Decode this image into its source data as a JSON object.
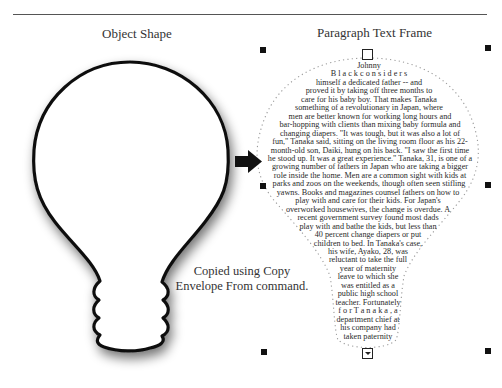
{
  "headings": {
    "object_shape": "Object Shape",
    "paragraph_text_frame": "Paragraph Text Frame"
  },
  "caption": {
    "line1": "Copied using Copy",
    "line2": "Envelope From command."
  },
  "arrow": {
    "icon": "right-arrow-icon",
    "color": "#111111"
  },
  "handles": {
    "selection_handles": [
      "top-left",
      "top-right",
      "middle-left",
      "middle-right",
      "bottom-left",
      "bottom-right"
    ],
    "top_center": "empty-square-handle",
    "bottom_center": "text-overflow-handle"
  },
  "paragraph": {
    "lines": [
      "Johnny",
      "B l a c k   c o n s i d e r s",
      "himself a dedicated father -- and",
      "proved it by taking off three months to",
      "care for his baby boy. That makes Tanaka",
      "something of a revolutionary in Japan, where",
      "men are better known for working long hours and",
      "bar-hopping with clients than mixing baby formula and",
      "changing diapers. \"It was tough, but it was also a lot of",
      "fun,\" Tanaka said, sitting on the living room floor as his 22-",
      "month-old son, Daiki, hung on his back. \"I saw the first time",
      "he stood up. It was a great experience.\" Tanaka, 31, is one of a",
      "growing number of fathers in Japan who are taking a bigger",
      "role inside the home. Men are a common sight with kids at",
      "parks and zoos on the weekends, though often seen stifling",
      "yawns. Books and magazines counsel fathers on how to",
      "play  with  and  care  for  their  kids.  For  Japan's",
      "overworked housewives, the change is overdue. A",
      "recent government survey found most dads",
      "play with and bathe the kids, but less than",
      "40  percent  change  diapers  or  put",
      "children to bed. In Tanaka's case,",
      "his  wife,  Ayako,  28,  was",
      "reluctant to take the full",
      "year  of  maternity",
      "leave to which she",
      "was  entitled  as  a",
      "public  high  school",
      "teacher. Fortunately",
      "f o r   T a n a k a ,   a",
      "department  chief  at",
      "his  company  had",
      "taken  paternity"
    ]
  },
  "colors": {
    "outline": "#111111",
    "shadow": "#9a9a9a",
    "envelope_dots": "#9a9a9a",
    "rule": "#555555"
  }
}
